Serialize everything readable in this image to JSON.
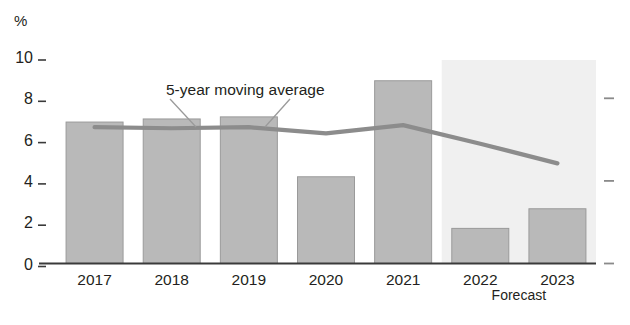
{
  "chart_data": {
    "type": "bar",
    "title": "",
    "subtitle": "",
    "xlabel": "",
    "ylabel": "%",
    "ylim": [
      0,
      10
    ],
    "yticks": [
      0,
      2,
      4,
      6,
      8,
      10
    ],
    "ytick_labels": [
      "0",
      "2",
      "4",
      "6",
      "8",
      "10"
    ],
    "grid": false,
    "legend_position": "none",
    "categories": [
      "2017",
      "2018",
      "2019",
      "2020",
      "2021",
      "2022",
      "2023"
    ],
    "values": [
      6.85,
      7.0,
      7.1,
      4.2,
      8.85,
      1.7,
      2.65
    ],
    "series": [
      {
        "name": "5-year moving average",
        "type": "line",
        "x": [
          "2017",
          "2018",
          "2019",
          "2020",
          "2021",
          "2022",
          "2023"
        ],
        "values": [
          6.6,
          6.55,
          6.6,
          6.3,
          6.7,
          5.8,
          4.85
        ]
      }
    ],
    "annotations": [
      {
        "text": "5-year moving average",
        "target_x": "2018",
        "target_y": 6.55
      },
      {
        "text": "Forecast",
        "covers": [
          "2022",
          "2023"
        ]
      }
    ],
    "forecast_region": {
      "label": "Forecast",
      "start_category": "2022",
      "end_category": "2023",
      "shaded": true
    },
    "right_axis_ticks": [
      "0",
      "4",
      "8"
    ],
    "colors": {
      "bar_fill": "#b9b9b9",
      "bar_stroke": "#9a9a9a",
      "line": "#8c8c8c",
      "forecast_shade": "#f0f0f0",
      "axis": "#3a3a3a",
      "text": "#231f20"
    }
  }
}
